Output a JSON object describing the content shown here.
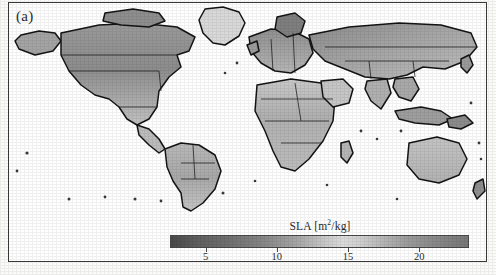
{
  "figure": {
    "panel_label": "(a)",
    "type": "choropleth-world-map"
  },
  "colorbar": {
    "title_main": "SLA [m",
    "title_sup": "2",
    "title_tail": "/kg]",
    "title_full": "SLA [m2/kg]",
    "orientation": "horizontal",
    "colormap": "grayscale",
    "tick_values": [
      5,
      10,
      15,
      20
    ],
    "tick_labels": [
      "5",
      "10",
      "15",
      "20"
    ],
    "range_min": 2.5,
    "range_max": 23.5,
    "colors": {
      "low": "#4a4a4a",
      "mid": "#dcdcdc",
      "high": "#787878",
      "outline": "#4a4a4a"
    }
  },
  "chart_data": {
    "type": "heatmap",
    "title": "",
    "xlabel": "",
    "ylabel": "",
    "variable": "SLA",
    "units": "m2/kg",
    "legend_position": "bottom",
    "grid": false,
    "colorbar_ticks": [
      5,
      10,
      15,
      20
    ],
    "value_range": [
      2.5,
      23.5
    ],
    "projection": "global lat-lon",
    "regions": [
      {
        "name": "North America - boreal Canada",
        "value": 11
      },
      {
        "name": "North America - western mountains",
        "value": 10
      },
      {
        "name": "North America - United States",
        "value": 14
      },
      {
        "name": "Central America",
        "value": 13
      },
      {
        "name": "South America - Amazon",
        "value": 13
      },
      {
        "name": "South America - Andes",
        "value": 11
      },
      {
        "name": "South America - southern cone",
        "value": 14
      },
      {
        "name": "Europe - northern",
        "value": 12
      },
      {
        "name": "Europe - central",
        "value": 15
      },
      {
        "name": "Mediterranean",
        "value": 9
      },
      {
        "name": "Africa - Sahel",
        "value": 13
      },
      {
        "name": "Africa - central",
        "value": 14
      },
      {
        "name": "Africa - southern",
        "value": 12
      },
      {
        "name": "Russia - Siberia",
        "value": 9
      },
      {
        "name": "Central Asia",
        "value": 8
      },
      {
        "name": "India",
        "value": 14
      },
      {
        "name": "Southeast Asia",
        "value": 14
      },
      {
        "name": "China - eastern",
        "value": 13
      },
      {
        "name": "Australia",
        "value": 15
      },
      {
        "name": "New Zealand",
        "value": 14
      }
    ]
  }
}
